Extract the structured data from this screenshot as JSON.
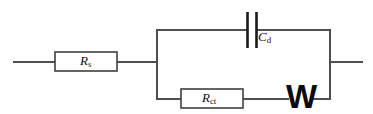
{
  "figure": {
    "kind": "equivalent-circuit-diagram",
    "name": "Randles equivalent circuit",
    "background_color": "#ffffff",
    "wire_color": "#4f4f4f",
    "component_outline_color": "#3f3f3f",
    "symbol_color": "#0b0b0b"
  },
  "components": {
    "series_resistor": {
      "label_main": "R",
      "label_sub": "s",
      "full_label": "Rs",
      "type": "resistor",
      "box": {
        "x": 55,
        "y": 52,
        "w": 62,
        "h": 19
      }
    },
    "charge_transfer_resistor": {
      "label_main": "R",
      "label_sub": "ct",
      "full_label": "Rct",
      "type": "resistor",
      "box": {
        "x": 181,
        "y": 89,
        "w": 62,
        "h": 19
      }
    },
    "double_layer_capacitor": {
      "label_main": "C",
      "label_sub": "d",
      "full_label": "Cd",
      "type": "capacitor",
      "plate_left_x": 247,
      "plate_right_x": 256,
      "plate_top_y": 12,
      "plate_bottom_y": 48
    },
    "warburg_element": {
      "label_main": "W",
      "label_sub": "",
      "full_label": "W",
      "type": "warburg-impedance",
      "x": 283,
      "y": 81
    }
  },
  "wires": {
    "left_terminal": {
      "x1": 13,
      "y1": 62,
      "x2": 55,
      "y2": 62
    },
    "rs_to_node": {
      "x1": 117,
      "y1": 62,
      "x2": 157,
      "y2": 62
    },
    "left_rail": {
      "x1": 157,
      "y1": 30,
      "x2": 157,
      "y2": 99
    },
    "right_rail": {
      "x1": 330,
      "y1": 30,
      "x2": 330,
      "y2": 99
    },
    "top_branch_left": {
      "x1": 157,
      "y1": 30,
      "x2": 247,
      "y2": 30
    },
    "top_branch_right": {
      "x1": 256,
      "y1": 30,
      "x2": 330,
      "y2": 30
    },
    "bottom_branch_left": {
      "x1": 157,
      "y1": 99,
      "x2": 181,
      "y2": 99
    },
    "bottom_branch_mid": {
      "x1": 243,
      "y1": 99,
      "x2": 288,
      "y2": 99
    },
    "bottom_branch_right": {
      "x1": 314,
      "y1": 99,
      "x2": 330,
      "y2": 99
    },
    "right_terminal": {
      "x1": 330,
      "y1": 62,
      "x2": 363,
      "y2": 62
    }
  }
}
